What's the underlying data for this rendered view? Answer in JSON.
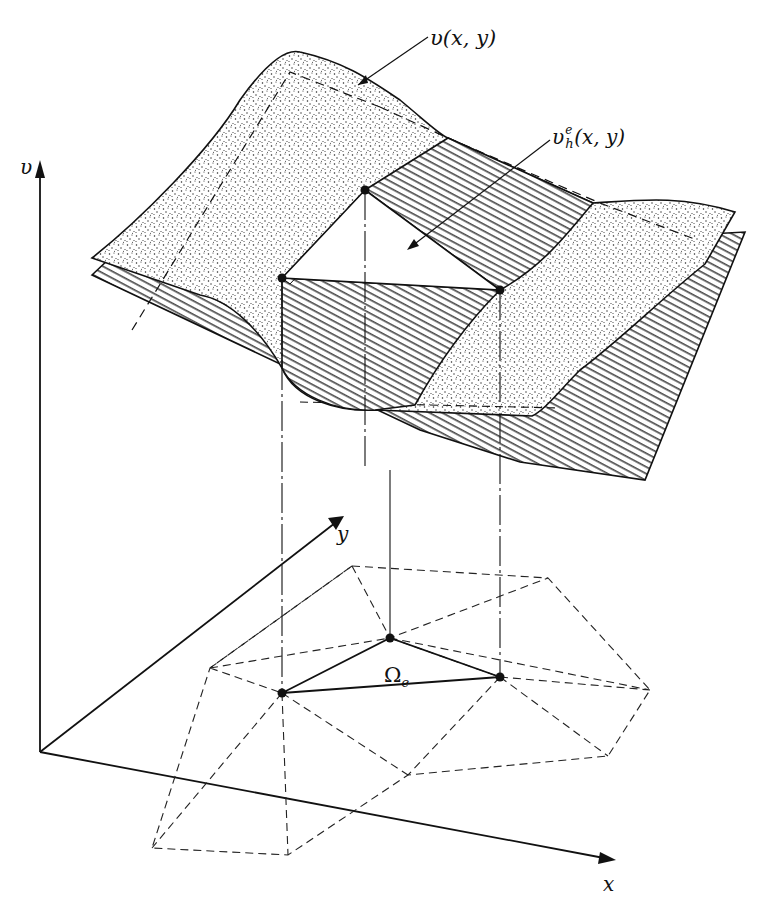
{
  "figure": {
    "labels": {
      "v_axis": "υ",
      "x_axis": "x",
      "y_axis": "y",
      "exact_surface": "υ(x, y)",
      "approx_surface_base": "υ",
      "approx_surface_sup": "e",
      "approx_surface_sub": "h",
      "approx_surface_args": "(x, y)",
      "element_symbol": "Ω",
      "element_sub": "e"
    },
    "legend": {
      "stippled_surface": "exact solution v(x, y)",
      "hatched_surface": "finite element approximation v_h^e(x, y)",
      "dashed_lines": "mesh of triangular elements in the x-y plane",
      "solid_triangle": "element Omega_e and its nodes"
    },
    "colors": {
      "ink": "#111111",
      "paper": "#ffffff"
    }
  }
}
